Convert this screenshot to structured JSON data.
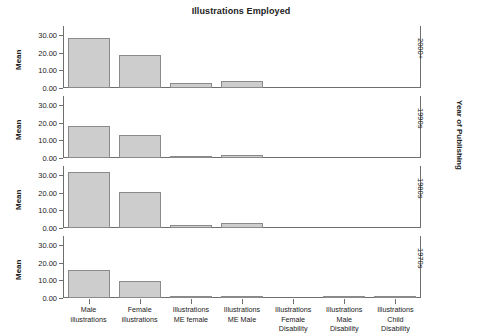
{
  "chart_data": {
    "type": "bar",
    "title": "Illustrations Employed",
    "xlabel": "",
    "ylabel": "Mean",
    "panel_label": "Year of Publishing",
    "grid": false,
    "legend": "none",
    "ylim": [
      0,
      35
    ],
    "yticks": [
      0.0,
      10.0,
      20.0,
      30.0
    ],
    "ytick_labels": [
      "0.00",
      "10.00",
      "20.00",
      "30.00"
    ],
    "categories": [
      "Male illustrations",
      "Female illustrations",
      "Illustrations ME female",
      "Illustrations ME Male",
      "Illustrations Female Disability",
      "Illustrations Male Disability",
      "Illustrations Child Disability"
    ],
    "category_lines": [
      [
        "Male",
        "illustrations"
      ],
      [
        "Female",
        "illustrations"
      ],
      [
        "Illustrations",
        "ME female"
      ],
      [
        "Illustrations",
        "ME Male"
      ],
      [
        "Illustrations",
        "Female",
        "Disability"
      ],
      [
        "Illustrations",
        "Male",
        "Disability"
      ],
      [
        "Illustrations",
        "Child",
        "Disability"
      ]
    ],
    "panels": [
      {
        "label": "2000+",
        "values": [
          28.0,
          18.7,
          2.7,
          3.8,
          0.0,
          0.0,
          0.0
        ]
      },
      {
        "label": "1990s",
        "values": [
          18.0,
          13.2,
          1.4,
          1.6,
          0.0,
          0.0,
          0.0
        ]
      },
      {
        "label": "1980s",
        "values": [
          31.5,
          20.1,
          1.7,
          2.9,
          0.0,
          0.0,
          0.0
        ]
      },
      {
        "label": "1970s",
        "values": [
          15.8,
          9.8,
          0.3,
          1.0,
          0.0,
          0.9,
          0.8
        ]
      }
    ],
    "colors": {
      "bar_fill": "#cdcdcd",
      "bar_border": "#8a8a8a",
      "axis": "#6e6e6e",
      "text": "#222222",
      "background": "#ffffff"
    }
  }
}
